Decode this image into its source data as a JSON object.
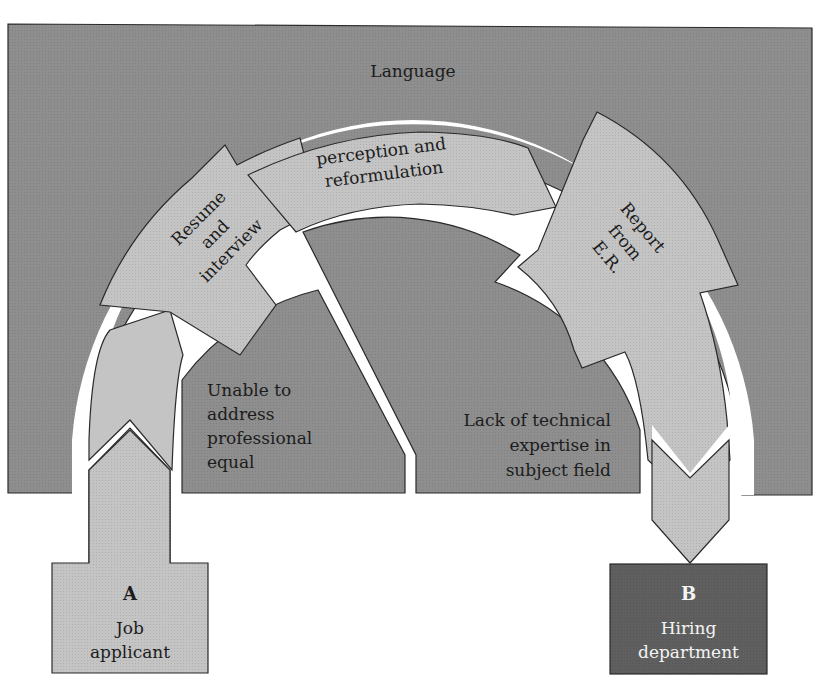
{
  "diagram": {
    "type": "communication-flow",
    "colors": {
      "background_region": "#8e8e8e",
      "arch_fill": "#c4c4c4",
      "gap": "#ffffff",
      "outline": "#2a2a2a",
      "node_a_fill": "#c4c4c4",
      "node_b_fill": "#5f5f5f",
      "text_dark": "#1c1c1c",
      "text_light": "#f4f4f4"
    },
    "region_label": "Language",
    "arch_segments": [
      {
        "id": "resume",
        "lines": [
          "Resume",
          "and",
          "interview"
        ]
      },
      {
        "id": "perception",
        "lines": [
          "perception and",
          "reformulation"
        ]
      },
      {
        "id": "report",
        "lines": [
          "Report",
          "from",
          "E.R."
        ]
      }
    ],
    "barriers": [
      {
        "id": "unable",
        "lines": [
          "Unable to",
          "address",
          "professional",
          "equal"
        ]
      },
      {
        "id": "lack",
        "lines": [
          "Lack of technical",
          "expertise in",
          "subject field"
        ]
      }
    ],
    "nodes": {
      "a": {
        "letter": "A",
        "lines": [
          "Job",
          "applicant"
        ]
      },
      "b": {
        "letter": "B",
        "lines": [
          "Hiring",
          "department"
        ]
      }
    }
  }
}
